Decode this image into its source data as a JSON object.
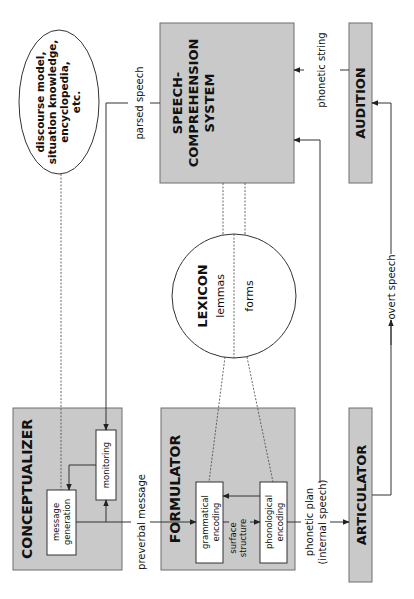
{
  "diagram": {
    "orientation": "rotated 90° counter-clockwise",
    "components": {
      "conceptualizer": {
        "label": "CONCEPTUALIZER",
        "sub": {
          "message_generation": [
            "message",
            "generation"
          ],
          "monitoring": "monitoring"
        }
      },
      "formulator": {
        "label": "FORMULATOR",
        "sub": {
          "grammatical_encoding": [
            "grammatical",
            "encoding"
          ],
          "surface_structure": [
            "surface",
            "structure"
          ],
          "phonological_encoding": [
            "phonological",
            "encoding"
          ]
        }
      },
      "articulator": {
        "label": "ARTICULATOR"
      },
      "speech_comprehension": {
        "label": [
          "SPEECH-",
          "COMPREHENSION",
          "SYSTEM"
        ]
      },
      "audition": {
        "label": "AUDITION"
      },
      "lexicon": {
        "label": "LEXICON",
        "lemmas": "lemmas",
        "forms": "forms"
      },
      "knowledge": {
        "label": [
          "discourse model,",
          "situation knowledge,",
          "encyclopedia,",
          "etc."
        ]
      }
    },
    "edges": {
      "preverbal_message": "preverbal message",
      "phonetic_plan": [
        "phonetic plan",
        "(internal speech)"
      ],
      "overt_speech": "overt speech",
      "phonetic_string": "phonetic string",
      "parsed_speech": "parsed speech"
    },
    "colors": {
      "box_fill": "#c9c9c9",
      "box_stroke": "#6e6e6e",
      "line": "#333333"
    }
  }
}
